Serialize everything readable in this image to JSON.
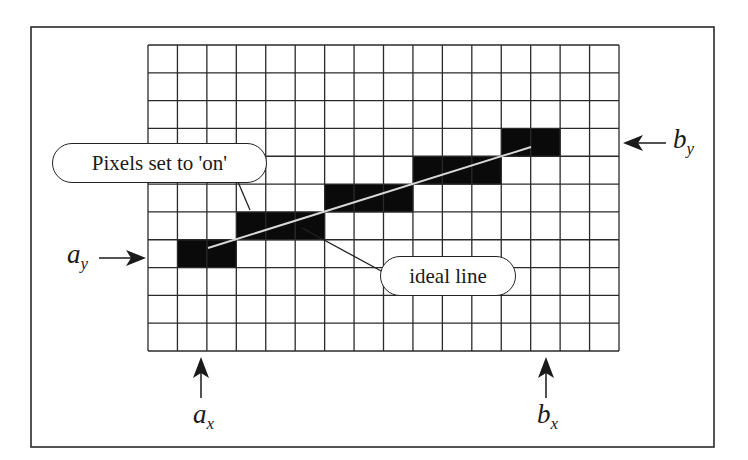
{
  "diagram": {
    "grid": {
      "columns": 16,
      "rows": 11
    },
    "pixels_on": [
      {
        "row": 7,
        "cols": [
          1,
          2
        ]
      },
      {
        "row": 6,
        "cols": [
          3,
          4,
          5
        ]
      },
      {
        "row": 5,
        "cols": [
          6,
          7,
          8
        ]
      },
      {
        "row": 4,
        "cols": [
          9,
          10,
          11
        ]
      },
      {
        "row": 3,
        "cols": [
          12,
          13
        ]
      }
    ],
    "callouts": {
      "pixels_on": "Pixels set to 'on'",
      "ideal_line": "ideal line"
    },
    "labels": {
      "ay": {
        "base": "a",
        "sub": "y"
      },
      "by": {
        "base": "b",
        "sub": "y"
      },
      "ax": {
        "base": "a",
        "sub": "x"
      },
      "bx": {
        "base": "b",
        "sub": "x"
      }
    },
    "colors": {
      "pixel_fill": "#0a0a0a",
      "grid_line": "#2a2a2a",
      "ideal_line": "#d8d8d8",
      "frame": "#2a2a2a"
    }
  }
}
